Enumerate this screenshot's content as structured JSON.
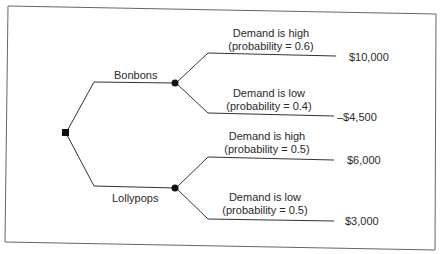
{
  "diagram": {
    "type": "decision-tree",
    "decision_node": {
      "shape": "square"
    },
    "options": [
      {
        "label": "Bonbons",
        "outcomes": [
          {
            "label": "Demand is high",
            "probability_text": "(probability = 0.6)",
            "probability": 0.6,
            "payoff": "$10,000"
          },
          {
            "label": "Demand is low",
            "probability_text": "(probability = 0.4)",
            "probability": 0.4,
            "payoff": "–$4,500"
          }
        ]
      },
      {
        "label": "Lollypops",
        "outcomes": [
          {
            "label": "Demand is high",
            "probability_text": "(probability = 0.5)",
            "probability": 0.5,
            "payoff": "$6,000"
          },
          {
            "label": "Demand is low",
            "probability_text": "(probability = 0.5)",
            "probability": 0.5,
            "payoff": "$3,000"
          }
        ]
      }
    ],
    "colors": {
      "line": "#333333",
      "frame": "#555555",
      "text": "#2a2a2a"
    }
  }
}
